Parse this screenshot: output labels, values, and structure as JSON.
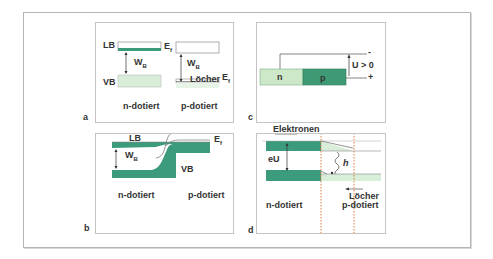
{
  "colors": {
    "dark_green": "#3d9b7d",
    "light_green": "#d9eed9",
    "n_green": "#cde8c8",
    "p_green": "#3e9a74",
    "line": "#555555",
    "dotted_orange": "#e07a3a"
  },
  "panels": {
    "a": {
      "letter": "a",
      "lb": "LB",
      "vb": "VB",
      "wb": "W",
      "wb_sub": "B",
      "ef1": "E",
      "ef1_sub": "f",
      "ef2": "E",
      "ef2_sub": "f",
      "wb2": "W",
      "wb2_sub": "B",
      "locher": "Löcher",
      "n_label": "n-dotiert",
      "p_label": "p-dotiert"
    },
    "b": {
      "letter": "b",
      "lb": "LB",
      "vb": "VB",
      "ef": "E",
      "ef_sub": "f",
      "wb": "W",
      "wb_sub": "B",
      "n_label": "n-dotiert",
      "p_label": "p-dotiert"
    },
    "c": {
      "letter": "c",
      "n": "n",
      "p": "p",
      "voltage": "U > 0",
      "minus": "-",
      "plus": "+"
    },
    "d": {
      "letter": "d",
      "elektronen": "Elektronen",
      "eu": "eU",
      "h": "h",
      "locher": "Löcher",
      "n_label": "n-dotiert",
      "p_label": "p-dotiert"
    }
  }
}
